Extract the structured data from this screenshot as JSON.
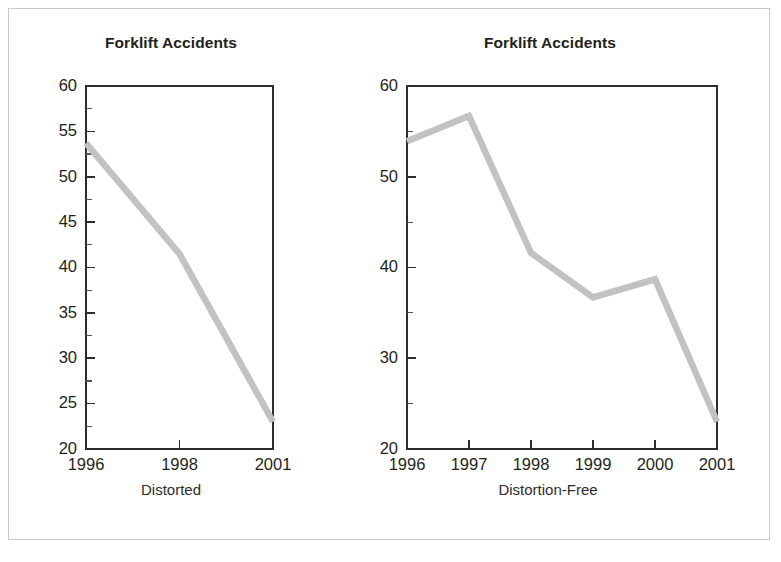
{
  "figure": {
    "background_color": "#ffffff",
    "frame_color": "#c9c9c9",
    "line_color": "#c2c2c2",
    "text_color": "#231f20"
  },
  "panels": [
    {
      "key": "distorted",
      "title": "Forklift Accidents",
      "caption": "Distorted"
    },
    {
      "key": "distortion_free",
      "title": "Forklift Accidents",
      "caption": "Distortion-Free"
    }
  ],
  "chart_data": [
    {
      "type": "line",
      "title": "Forklift Accidents",
      "caption": "Distorted",
      "xlabel": "",
      "ylabel": "",
      "grid": false,
      "legend": "none",
      "note": "Only three years plotted at equal spacing, compressing 1998-2001 and producing a steady-looking decline.",
      "categories": [
        "1996",
        "1998",
        "2001"
      ],
      "x_tick_labels": [
        "1996",
        "1998",
        "2001"
      ],
      "values": [
        53.7,
        41.5,
        23.0
      ],
      "ylim": [
        20,
        60
      ],
      "y_tick_labels": [
        "20",
        "25",
        "30",
        "35",
        "40",
        "45",
        "50",
        "55",
        "60"
      ],
      "y_major_ticks": [
        20,
        25,
        30,
        35,
        40,
        45,
        50,
        55,
        60
      ],
      "y_minor_ticks": [
        22.5,
        27.5,
        32.5,
        37.5,
        42.5,
        47.5,
        52.5,
        57.5
      ]
    },
    {
      "type": "line",
      "title": "Forklift Accidents",
      "caption": "Distortion-Free",
      "xlabel": "",
      "ylabel": "",
      "grid": false,
      "legend": "none",
      "note": "All six years plotted, revealing the 1997 peak and the 1999-2000 uptick.",
      "categories": [
        "1996",
        "1997",
        "1998",
        "1999",
        "2000",
        "2001"
      ],
      "x_tick_labels": [
        "1996",
        "1997",
        "1998",
        "1999",
        "2000",
        "2001"
      ],
      "values": [
        53.9,
        56.7,
        41.6,
        36.7,
        38.7,
        23.0
      ],
      "ylim": [
        20,
        60
      ],
      "y_tick_labels": [
        "20",
        "30",
        "40",
        "50",
        "60"
      ],
      "y_major_ticks": [
        20,
        30,
        40,
        50,
        60
      ],
      "y_minor_ticks": [
        25,
        35,
        45,
        55
      ]
    }
  ]
}
